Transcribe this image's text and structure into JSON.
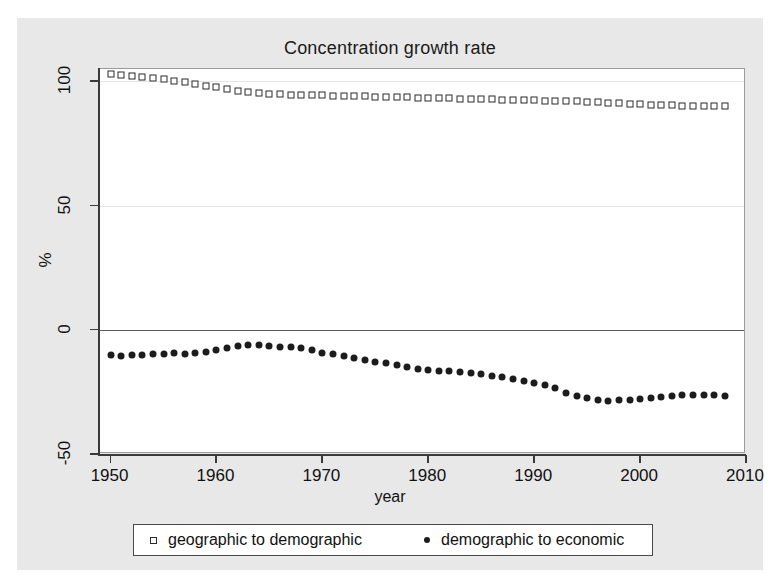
{
  "chart_data": {
    "type": "scatter",
    "title": "Concentration growth rate",
    "xlabel": "year",
    "ylabel": "%",
    "xlim": [
      1949,
      2010
    ],
    "ylim": [
      -50,
      105
    ],
    "xticks": [
      1950,
      1960,
      1970,
      1980,
      1990,
      2000,
      2010
    ],
    "yticks": [
      -50,
      0,
      50,
      100
    ],
    "grid": true,
    "legend_position": "bottom",
    "series": [
      {
        "name": "geographic to demographic",
        "marker": "open-square",
        "color": "#2a2a2a",
        "x": [
          1950,
          1951,
          1952,
          1953,
          1954,
          1955,
          1956,
          1957,
          1958,
          1959,
          1960,
          1961,
          1962,
          1963,
          1964,
          1965,
          1966,
          1967,
          1968,
          1969,
          1970,
          1971,
          1972,
          1973,
          1974,
          1975,
          1976,
          1977,
          1978,
          1979,
          1980,
          1981,
          1982,
          1983,
          1984,
          1985,
          1986,
          1987,
          1988,
          1989,
          1990,
          1991,
          1992,
          1993,
          1994,
          1995,
          1996,
          1997,
          1998,
          1999,
          2000,
          2001,
          2002,
          2003,
          2004,
          2005,
          2006,
          2007,
          2008
        ],
        "values": [
          103.0,
          102.6,
          102.2,
          101.8,
          101.3,
          100.8,
          100.2,
          99.6,
          99.0,
          98.3,
          97.6,
          96.9,
          96.3,
          95.8,
          95.4,
          95.1,
          94.9,
          94.7,
          94.6,
          94.5,
          94.4,
          94.3,
          94.2,
          94.1,
          94.0,
          93.9,
          93.8,
          93.7,
          93.6,
          93.5,
          93.4,
          93.3,
          93.2,
          93.1,
          93.0,
          92.9,
          92.8,
          92.7,
          92.6,
          92.5,
          92.4,
          92.3,
          92.2,
          92.1,
          92.0,
          91.8,
          91.6,
          91.4,
          91.2,
          91.0,
          90.8,
          90.6,
          90.5,
          90.4,
          90.3,
          90.2,
          90.1,
          90.0,
          90.0
        ]
      },
      {
        "name": "demographic to economic",
        "marker": "filled-circle",
        "color": "#1c1c1c",
        "x": [
          1950,
          1951,
          1952,
          1953,
          1954,
          1955,
          1956,
          1957,
          1958,
          1959,
          1960,
          1961,
          1962,
          1963,
          1964,
          1965,
          1966,
          1967,
          1968,
          1969,
          1970,
          1971,
          1972,
          1973,
          1974,
          1975,
          1976,
          1977,
          1978,
          1979,
          1980,
          1981,
          1982,
          1983,
          1984,
          1985,
          1986,
          1987,
          1988,
          1989,
          1990,
          1991,
          1992,
          1993,
          1994,
          1995,
          1996,
          1997,
          1998,
          1999,
          2000,
          2001,
          2002,
          2003,
          2004,
          2005,
          2006,
          2007,
          2008
        ],
        "values": [
          -10.2,
          -10.5,
          -10.3,
          -10.0,
          -9.8,
          -9.7,
          -9.5,
          -9.6,
          -9.4,
          -9.0,
          -8.3,
          -7.2,
          -6.5,
          -6.2,
          -6.3,
          -6.6,
          -6.9,
          -7.0,
          -7.2,
          -8.3,
          -9.4,
          -9.8,
          -10.4,
          -11.2,
          -12.0,
          -12.8,
          -13.5,
          -14.3,
          -15.0,
          -15.6,
          -16.2,
          -16.6,
          -16.4,
          -16.9,
          -17.4,
          -17.9,
          -18.4,
          -19.1,
          -19.9,
          -20.6,
          -21.3,
          -22.2,
          -23.6,
          -25.4,
          -26.8,
          -27.6,
          -28.2,
          -28.7,
          -28.4,
          -28.3,
          -27.8,
          -27.4,
          -27.0,
          -26.7,
          -26.4,
          -26.3,
          -26.2,
          -26.4,
          -26.5
        ]
      }
    ]
  }
}
